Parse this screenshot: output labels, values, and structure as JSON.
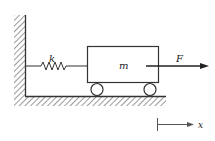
{
  "diagram": {
    "type": "mass-spring-system",
    "labels": {
      "spring": "k",
      "mass": "m",
      "force": "F",
      "axis": "x"
    },
    "colors": {
      "stroke": "#333333",
      "background": "#ffffff"
    }
  }
}
